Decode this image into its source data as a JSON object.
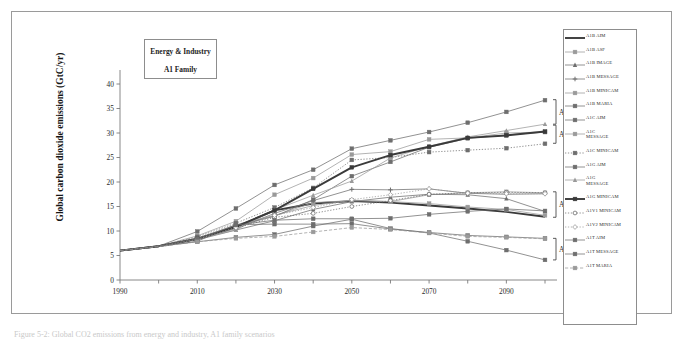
{
  "figure": {
    "title_box": {
      "line1": "Energy & Industry",
      "line2": "A1 Family"
    },
    "caption": "Figure 5-2:  Global CO2 emissions from energy and industry, A1 family scenarios",
    "y_axis_title": "Global carbon dioxide emissions (GtC/yr)"
  },
  "brackets": [
    {
      "label": "A1C",
      "y_top": 36.8,
      "y_bottom": 31.8
    },
    {
      "label": "A1G",
      "y_top": 31.6,
      "y_bottom": 27.9
    },
    {
      "label": "A1B",
      "y_top": 18.0,
      "y_bottom": 12.8
    },
    {
      "label": "A1T",
      "y_top": 8.5,
      "y_bottom": 4.1
    }
  ],
  "colors": {
    "line_dark": "#3a3a3a",
    "line_mid": "#6e6e6e",
    "line_light": "#9a9a9a",
    "axis": "#7b7b7b",
    "frame": "#9a9a9a",
    "text": "#1d1d1d"
  },
  "chart_data": {
    "type": "line",
    "xlabel": "",
    "ylabel": "Global carbon dioxide emissions (GtC/yr)",
    "xlim": [
      1990,
      2100
    ],
    "ylim": [
      0,
      40
    ],
    "xticks": [
      1990,
      2000,
      2010,
      2020,
      2030,
      2040,
      2050,
      2060,
      2070,
      2080,
      2090,
      2100
    ],
    "xtick_labels": [
      "1990",
      "",
      "2010",
      "",
      "2030",
      "",
      "2050",
      "",
      "2070",
      "",
      "2090",
      ""
    ],
    "yticks": [
      0,
      5,
      10,
      15,
      20,
      25,
      30,
      35,
      40
    ],
    "grid": false,
    "legend_position": "right-outside",
    "x": [
      1990,
      2000,
      2010,
      2020,
      2030,
      2040,
      2050,
      2060,
      2070,
      2080,
      2090,
      2100
    ],
    "series": [
      {
        "name": "A1B AIM",
        "style": "solid-thick",
        "marker": "none",
        "values": [
          6.0,
          6.9,
          8.4,
          10.8,
          14.2,
          15.6,
          16.1,
          15.8,
          15.2,
          14.6,
          13.9,
          12.9
        ]
      },
      {
        "name": "A1B ASF",
        "style": "solid",
        "marker": "square",
        "values": [
          6.0,
          6.9,
          8.6,
          11.1,
          13.1,
          15.8,
          16.2,
          16.0,
          17.4,
          17.8,
          18.0,
          17.8
        ]
      },
      {
        "name": "A1B IMAGE",
        "style": "solid",
        "marker": "triangle",
        "values": [
          6.0,
          6.9,
          8.2,
          10.2,
          12.1,
          14.4,
          16.0,
          16.9,
          17.5,
          17.4,
          16.6,
          14.0
        ]
      },
      {
        "name": "A1B MESSAGE",
        "style": "solid",
        "marker": "cross",
        "values": [
          6.0,
          6.9,
          8.3,
          10.5,
          13.6,
          16.2,
          18.5,
          18.4,
          18.6,
          17.7,
          17.5,
          17.6
        ]
      },
      {
        "name": "A1B MINICAM",
        "style": "solid",
        "marker": "square",
        "values": [
          6.0,
          6.9,
          8.4,
          11.3,
          13.2,
          15.2,
          16.3,
          16.0,
          15.6,
          14.9,
          14.4,
          13.2
        ]
      },
      {
        "name": "A1B MARIA",
        "style": "solid",
        "marker": "square",
        "values": [
          6.0,
          6.8,
          7.9,
          11.3,
          11.4,
          11.4,
          11.5,
          10.4,
          9.7,
          9.1,
          8.8,
          8.5
        ]
      },
      {
        "name": "A1C AIM",
        "style": "solid",
        "marker": "square",
        "values": [
          6.0,
          6.9,
          9.9,
          14.6,
          19.4,
          22.5,
          26.8,
          28.5,
          30.2,
          32.1,
          34.3,
          36.7
        ]
      },
      {
        "name": "A1C MESSAGE",
        "style": "solid",
        "marker": "square",
        "values": [
          6.0,
          6.9,
          9.0,
          12.0,
          17.4,
          20.8,
          25.6,
          26.2,
          28.7,
          29.0,
          30.0,
          30.2
        ]
      },
      {
        "name": "A1C MINICAM",
        "style": "dotted",
        "marker": "square",
        "values": [
          6.0,
          6.9,
          8.8,
          11.6,
          14.8,
          18.8,
          24.5,
          25.0,
          26.1,
          26.5,
          26.9,
          27.8
        ]
      },
      {
        "name": "A1G AIM",
        "style": "solid",
        "marker": "square",
        "values": [
          6.0,
          6.9,
          8.4,
          11.0,
          13.0,
          16.4,
          21.2,
          24.1,
          27.1,
          28.9,
          29.6,
          30.2
        ]
      },
      {
        "name": "A1G MESSAGE",
        "style": "solid",
        "marker": "triangle",
        "values": [
          6.0,
          6.9,
          8.4,
          10.2,
          14.3,
          17.3,
          20.2,
          24.9,
          27.3,
          29.2,
          30.5,
          31.8
        ]
      },
      {
        "name": "A1G MINICAM",
        "style": "solid-thick",
        "marker": "square",
        "values": [
          6.0,
          6.9,
          8.4,
          10.9,
          14.2,
          18.6,
          23.0,
          25.5,
          27.2,
          29.0,
          29.5,
          30.3
        ]
      },
      {
        "name": "A1V1 MINICAM",
        "style": "dotted",
        "marker": "circle-open",
        "values": [
          6.0,
          6.9,
          8.3,
          10.6,
          12.8,
          13.6,
          15.0,
          16.2,
          17.5,
          17.8,
          17.9,
          17.8
        ]
      },
      {
        "name": "A1V2 MINICAM",
        "style": "dotted",
        "marker": "diamond-open",
        "values": [
          6.0,
          6.9,
          8.3,
          10.7,
          13.2,
          14.8,
          16.4,
          17.4,
          18.6,
          17.7,
          17.6,
          17.6
        ]
      },
      {
        "name": "A1T AIM",
        "style": "solid",
        "marker": "square",
        "values": [
          6.0,
          6.9,
          8.4,
          11.2,
          12.2,
          12.5,
          12.5,
          12.6,
          13.4,
          14.0,
          14.5,
          14.1
        ]
      },
      {
        "name": "A1T MESSAGE",
        "style": "solid",
        "marker": "square",
        "values": [
          6.0,
          6.9,
          7.8,
          8.7,
          9.3,
          11.0,
          12.4,
          10.5,
          9.6,
          7.9,
          6.1,
          4.1
        ]
      },
      {
        "name": "A1T MARIA",
        "style": "dashed",
        "marker": "square",
        "values": [
          6.0,
          6.8,
          7.8,
          8.5,
          8.9,
          9.8,
          10.7,
          10.3,
          9.6,
          8.9,
          8.7,
          8.4
        ]
      }
    ]
  },
  "legend": {
    "entries": [
      {
        "label": "A1B AIM",
        "style": "solid-thick",
        "marker": "none"
      },
      {
        "label": "A1B ASF",
        "style": "solid",
        "marker": "square"
      },
      {
        "label": "A1B IMAGE",
        "style": "solid",
        "marker": "triangle"
      },
      {
        "label": "A1B MESSAGE",
        "style": "solid",
        "marker": "cross"
      },
      {
        "label": "A1B MINICAM",
        "style": "solid",
        "marker": "square"
      },
      {
        "label": "A1B MARIA",
        "style": "solid",
        "marker": "square"
      },
      {
        "label": "A1C AIM",
        "style": "solid",
        "marker": "square"
      },
      {
        "label": "A1C\nMESSAGE",
        "style": "solid",
        "marker": "square"
      },
      {
        "label": "A1C MINICAM",
        "style": "dotted",
        "marker": "square"
      },
      {
        "label": "A1G AIM",
        "style": "solid",
        "marker": "square"
      },
      {
        "label": "A1G\nMESSAGE",
        "style": "solid",
        "marker": "triangle"
      },
      {
        "label": "A1G MINICAM",
        "style": "solid-thick",
        "marker": "square"
      },
      {
        "label": "A1V1 MINICAM",
        "style": "dotted",
        "marker": "circle-open"
      },
      {
        "label": "A1V2 MINICAM",
        "style": "dotted",
        "marker": "diamond-open"
      },
      {
        "label": "A1T AIM",
        "style": "solid",
        "marker": "square"
      },
      {
        "label": "A1T MESSAGE",
        "style": "solid",
        "marker": "square"
      },
      {
        "label": "A1T MARIA",
        "style": "dashed",
        "marker": "square"
      }
    ]
  }
}
